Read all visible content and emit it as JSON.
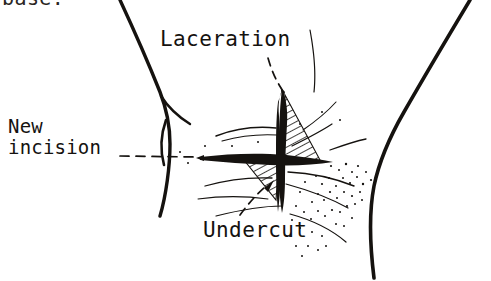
{
  "figure": {
    "kind": "surgical-line-art-illustration",
    "background_color": "#ffffff",
    "ink_color": "#15120f",
    "width": 491,
    "height": 281
  },
  "clipped_caption": {
    "text": "base.",
    "note": "text cropped at the very top edge of the frame"
  },
  "labels": [
    {
      "id": "laceration",
      "text": "Laceration",
      "leader": "dashed",
      "points_to": "dark vertical wound at center"
    },
    {
      "id": "new_incision",
      "text": "New\nincision",
      "line1": "New",
      "line2": "incision",
      "leader": "dashed",
      "points_to": "horizontal incision line crossing the wound"
    },
    {
      "id": "undercut",
      "text": "Undercut",
      "leader": "dashed-with-arrowhead",
      "points_to": "hatched undermined flap below-left of the wound"
    }
  ],
  "drawing_elements": [
    {
      "name": "left-body-contour",
      "style": "solid thick ink stroke"
    },
    {
      "name": "right-body-contour",
      "style": "solid thick ink stroke"
    },
    {
      "name": "laceration-wound",
      "style": "solid black vertical spindle"
    },
    {
      "name": "new-incision-line",
      "style": "solid black horizontal stroke"
    },
    {
      "name": "undercut-flap-upper-right",
      "style": "diagonal hatching"
    },
    {
      "name": "undercut-flap-lower-left",
      "style": "diagonal hatching"
    },
    {
      "name": "skin-crease-lines",
      "style": "thin ink curves"
    },
    {
      "name": "stipple-shading",
      "style": "dotted stipple"
    }
  ]
}
